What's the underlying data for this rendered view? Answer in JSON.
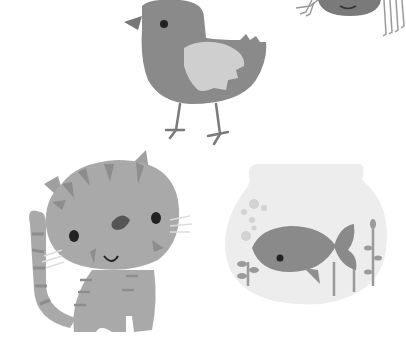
{
  "scene": {
    "description": "Grayscale cartoon illustration of pets",
    "background": "#ffffff",
    "figures": [
      {
        "name": "bird",
        "body_color": "#8a8a8a",
        "wing_color": "#cfcfcf"
      },
      {
        "name": "spider",
        "body_color": "#7a7a7a",
        "partial": true
      },
      {
        "name": "cat",
        "body_color": "#a9a9a9",
        "stripe_color": "#8d8d8d"
      },
      {
        "name": "fishbowl",
        "bowl_color": "#ededed",
        "fish_color": "#8a8a8a",
        "plant_color": "#9a9a9a"
      }
    ]
  }
}
